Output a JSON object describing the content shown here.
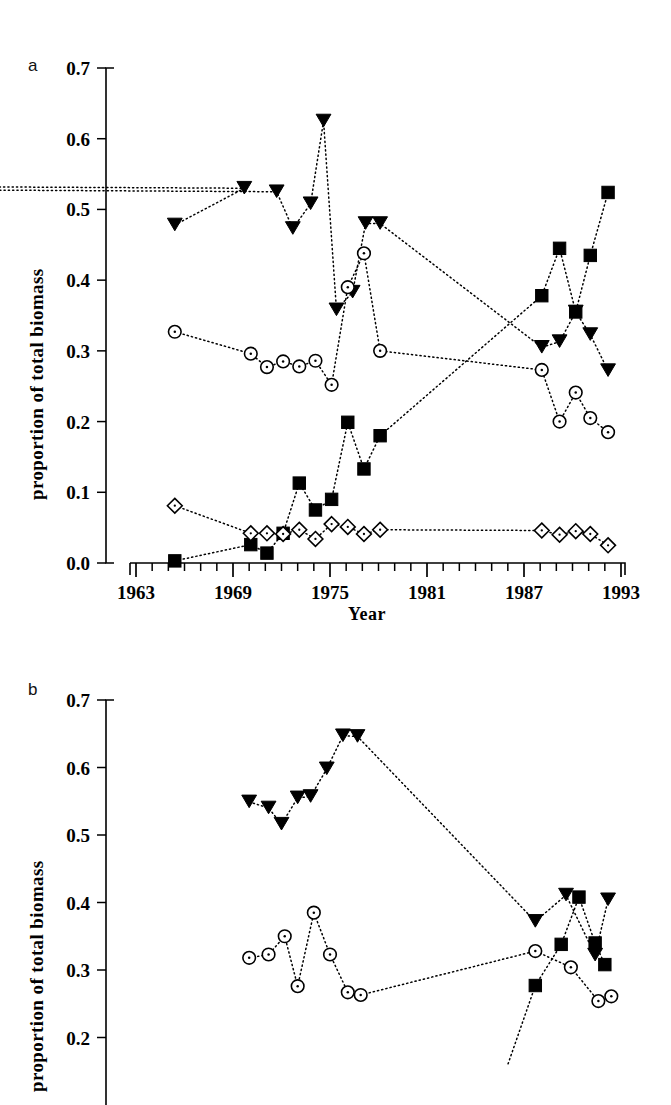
{
  "figure": {
    "panel_a_letter": "a",
    "panel_b_letter": "b",
    "ylabel": "proportion of total biomass",
    "xlabel": "Year"
  },
  "chart_data": [
    {
      "id": "panel_a",
      "type": "scatter",
      "title": "a",
      "xlabel": "Year",
      "ylabel": "proportion of total biomass",
      "xlim": [
        1963,
        1993
      ],
      "ylim": [
        0.0,
        0.7
      ],
      "xticks": [
        1963,
        1969,
        1975,
        1981,
        1987,
        1993
      ],
      "xticklabels": [
        "1963",
        "1969",
        "1975",
        "1981",
        "1987",
        "1993"
      ],
      "xminortick_interval": 1,
      "yticks": [
        0.0,
        0.1,
        0.2,
        0.3,
        0.4,
        0.5,
        0.6,
        0.7
      ],
      "yticklabels": [
        "0.0",
        "0.1",
        "0.2",
        "0.3",
        "0.4",
        "0.5",
        "0.6",
        "0.7"
      ],
      "grid": false,
      "legend": "none",
      "linestyle": "dotted",
      "series": [
        {
          "name": "filled-down-triangle",
          "marker": "triangle-down-filled",
          "x": [
            1965.4,
            1969.7,
            1670,
            1971.7,
            1972.7,
            1973.8,
            1974.6,
            1975.4,
            1976.4,
            1977.2,
            1978.1,
            1988.1,
            1989.2,
            1990.2,
            1991.1,
            1992.2
          ],
          "values": [
            0.478,
            0.53,
            0.565,
            0.525,
            0.473,
            0.508,
            0.625,
            0.358,
            0.383,
            0.48,
            0.48,
            0.305,
            0.313,
            0.355,
            0.323,
            0.272
          ]
        },
        {
          "name": "open-circle",
          "marker": "circle-open-dot",
          "x": [
            1965.4,
            1970.1,
            1971.1,
            1972.1,
            1973.1,
            1974.1,
            1975.1,
            1976.1,
            1977.1,
            1978.1,
            1988.1,
            1989.2,
            1990.2,
            1991.1,
            1992.2
          ],
          "values": [
            0.327,
            0.296,
            0.277,
            0.285,
            0.278,
            0.286,
            0.252,
            0.39,
            0.438,
            0.3,
            0.273,
            0.2,
            0.241,
            0.205,
            0.185
          ]
        },
        {
          "name": "filled-square",
          "marker": "square-filled",
          "x": [
            1965.4,
            1970.1,
            1971.1,
            1972.1,
            1973.1,
            1974.1,
            1975.1,
            1976.1,
            1977.1,
            1978.1,
            1988.1,
            1989.2,
            1990.2,
            1991.1,
            1992.2
          ],
          "values": [
            0.003,
            0.026,
            0.014,
            0.042,
            0.113,
            0.075,
            0.09,
            0.199,
            0.133,
            0.18,
            0.378,
            0.445,
            0.355,
            0.435,
            0.524
          ]
        },
        {
          "name": "open-diamond",
          "marker": "diamond-open-dot",
          "x": [
            1965.4,
            1970.1,
            1971.1,
            1972.1,
            1973.1,
            1974.1,
            1975.1,
            1976.1,
            1977.1,
            1978.1,
            1988.1,
            1989.2,
            1990.2,
            1991.1,
            1992.2
          ],
          "values": [
            0.081,
            0.042,
            0.042,
            0.041,
            0.047,
            0.034,
            0.055,
            0.051,
            0.041,
            0.047,
            0.046,
            0.04,
            0.045,
            0.041,
            0.025
          ]
        }
      ]
    },
    {
      "id": "panel_b",
      "type": "scatter",
      "title": "b",
      "xlabel": "",
      "ylabel": "proportion of total biomass",
      "xlim": [
        1963,
        1993
      ],
      "ylim": [
        0.15,
        0.7
      ],
      "yticks": [
        0.2,
        0.3,
        0.4,
        0.5,
        0.6,
        0.7
      ],
      "yticklabels": [
        "0.2",
        "0.3",
        "0.4",
        "0.5",
        "0.6",
        "0.7"
      ],
      "grid": false,
      "legend": "none",
      "linestyle": "dotted",
      "note": "panel cropped at bottom of image",
      "series": [
        {
          "name": "filled-down-triangle",
          "marker": "triangle-down-filled",
          "x": [
            1970.0,
            1971.2,
            1972.0,
            1973.0,
            1973.8,
            1974.8,
            1975.8,
            1976.7,
            1987.7,
            1989.6,
            1991.4,
            1992.2
          ],
          "values": [
            0.549,
            0.54,
            0.516,
            0.555,
            0.557,
            0.598,
            0.647,
            0.646,
            0.372,
            0.411,
            0.322,
            0.404
          ]
        },
        {
          "name": "open-circle",
          "marker": "circle-open-dot",
          "x": [
            1970.0,
            1971.2,
            1972.2,
            1973.0,
            1974.0,
            1975.0,
            1976.1,
            1976.9,
            1987.7,
            1989.9,
            1991.6,
            1992.4
          ],
          "values": [
            0.318,
            0.323,
            0.35,
            0.276,
            0.385,
            0.323,
            0.267,
            0.263,
            0.328,
            0.304,
            0.254,
            0.261
          ]
        },
        {
          "name": "filled-square",
          "marker": "square-filled",
          "x": [
            1987.7,
            1989.3,
            1990.4,
            1991.4,
            1992.0
          ],
          "values": [
            0.277,
            0.338,
            0.408,
            0.34,
            0.308
          ]
        }
      ]
    }
  ]
}
